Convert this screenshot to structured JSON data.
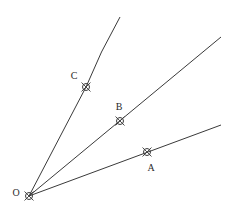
{
  "diagram": {
    "title": "",
    "stroke_color": "#3a3a3a",
    "background": "#ffffff",
    "origin": {
      "label": "O",
      "x": 29,
      "y": 196,
      "label_x": 16,
      "label_y": 193
    },
    "points": [
      {
        "id": "C",
        "label": "C",
        "x": 86,
        "y": 87,
        "label_x": 74,
        "label_y": 76
      },
      {
        "id": "B",
        "label": "B",
        "x": 120,
        "y": 121,
        "label_x": 119,
        "label_y": 107
      },
      {
        "id": "A",
        "label": "A",
        "x": 147,
        "y": 152,
        "label_x": 151,
        "label_y": 168
      }
    ],
    "rays": [
      {
        "id": "ray-OC",
        "through": "C",
        "end_x": 120,
        "end_y": 17,
        "ctrl_x": 100,
        "ctrl_y": 52
      },
      {
        "id": "ray-OB",
        "through": "B",
        "end_x": 221,
        "end_y": 37
      },
      {
        "id": "ray-OA",
        "through": "A",
        "end_x": 221,
        "end_y": 125
      }
    ]
  },
  "labels": {
    "O": "O",
    "A": "A",
    "B": "B",
    "C": "C"
  }
}
